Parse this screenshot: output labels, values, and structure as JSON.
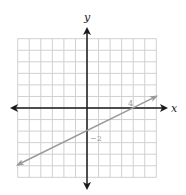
{
  "chart_data": {
    "type": "line",
    "title": "",
    "xlabel": "x",
    "ylabel": "y",
    "xlim": [
      -6,
      6
    ],
    "ylim": [
      -6,
      6
    ],
    "grid": true,
    "grid_step": 1,
    "series": [
      {
        "name": "line",
        "equation": "y = 0.5x - 2",
        "points": [
          [
            -6,
            -5
          ],
          [
            0,
            -2
          ],
          [
            4,
            0
          ],
          [
            6,
            1
          ]
        ],
        "arrows": "both"
      }
    ],
    "annotations": [
      {
        "text": "4",
        "x": 4,
        "y": 0,
        "meaning": "x-intercept"
      },
      {
        "text": "−2",
        "x": 0,
        "y": -2,
        "meaning": "y-intercept"
      }
    ]
  },
  "labels": {
    "x_axis": "x",
    "y_axis": "y",
    "x_intercept": "4",
    "y_intercept": "−2"
  },
  "colors": {
    "grid": "#d0d0d0",
    "axis": "#1a1a1a",
    "line": "#9a9a9a",
    "annotation": "#9a9a9a"
  }
}
